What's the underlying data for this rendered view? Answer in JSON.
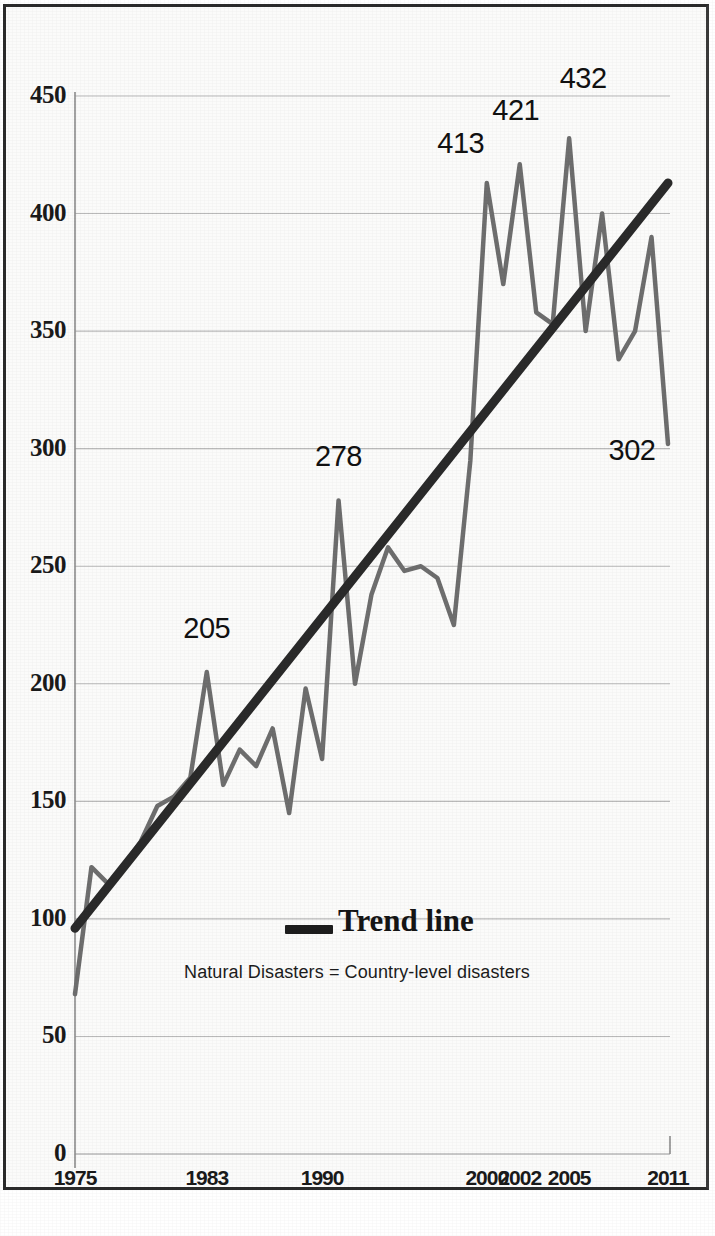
{
  "chart_data": {
    "type": "line",
    "title": "",
    "xlabel": "",
    "ylabel": "",
    "xlim": [
      1975,
      2011
    ],
    "ylim": [
      0,
      450
    ],
    "grid": true,
    "legend_position": "center-bottom",
    "x_tick_labels": [
      "1975",
      "1983",
      "1990",
      "2000",
      "2002",
      "2005",
      "2011"
    ],
    "x_tick_values": [
      1975,
      1983,
      1990,
      2000,
      2002,
      2005,
      2011
    ],
    "y_tick_labels": [
      "0",
      "50",
      "100",
      "150",
      "200",
      "250",
      "300",
      "350",
      "400",
      "450"
    ],
    "y_tick_values": [
      0,
      50,
      100,
      150,
      200,
      250,
      300,
      350,
      400,
      450
    ],
    "series": [
      {
        "name": "Natural Disasters",
        "color": "#6e6e6e",
        "x": [
          1975,
          1976,
          1977,
          1978,
          1979,
          1980,
          1981,
          1982,
          1983,
          1984,
          1985,
          1986,
          1987,
          1988,
          1989,
          1990,
          1991,
          1992,
          1993,
          1994,
          1995,
          1996,
          1997,
          1998,
          1999,
          2000,
          2001,
          2002,
          2003,
          2004,
          2005,
          2006,
          2007,
          2008,
          2009,
          2010,
          2011
        ],
        "values": [
          68,
          122,
          115,
          123,
          133,
          148,
          152,
          160,
          205,
          157,
          172,
          165,
          181,
          145,
          198,
          168,
          278,
          200,
          238,
          258,
          248,
          250,
          245,
          225,
          295,
          413,
          370,
          421,
          358,
          353,
          432,
          350,
          400,
          338,
          350,
          390,
          302
        ]
      },
      {
        "name": "Trend line",
        "color": "#2a2a2a",
        "x": [
          1975,
          2011
        ],
        "values": [
          96,
          413
        ]
      }
    ],
    "point_labels": [
      {
        "text": "205",
        "x": 1983,
        "y": 205
      },
      {
        "text": "278",
        "x": 1991,
        "y": 278
      },
      {
        "text": "413",
        "x": 2000,
        "y": 413
      },
      {
        "text": "421",
        "x": 2002,
        "y": 421
      },
      {
        "text": "432",
        "x": 2005,
        "y": 432
      },
      {
        "text": "302",
        "x": 2011,
        "y": 302
      }
    ],
    "legend": {
      "label": "Trend line",
      "swatch_color": "#1d1d1d"
    },
    "annotation": "Natural Disasters = Country-level disasters"
  },
  "axes": {
    "y_labels": [
      "450",
      "400",
      "350",
      "300",
      "250",
      "200",
      "150",
      "100",
      "50",
      "0"
    ],
    "x_labels": [
      "1975",
      "1983",
      "1990",
      "2000",
      "2002",
      "2005",
      "2011"
    ]
  },
  "labels": {
    "p205": "205",
    "p278": "278",
    "p413": "413",
    "p421": "421",
    "p432": "432",
    "p302": "302"
  },
  "legend": {
    "trend_label": "Trend line",
    "caption": "Natural Disasters = Country-level disasters"
  },
  "colors": {
    "series_line": "#6e6e6e",
    "trend_line": "#2a2a2a",
    "grid": "#b9b9b9",
    "axis": "#8d8d8d",
    "frame": "#2b2b2b",
    "background": "#fbfbfa"
  }
}
